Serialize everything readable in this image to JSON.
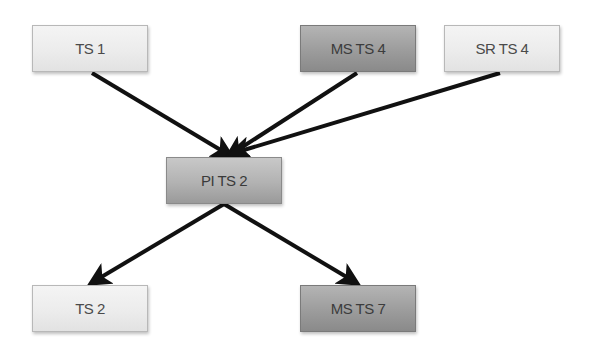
{
  "diagram": {
    "nodes": [
      {
        "id": "ts1",
        "label": "TS 1",
        "shade": "light"
      },
      {
        "id": "msts4",
        "label": "MS TS 4",
        "shade": "dark"
      },
      {
        "id": "srts4",
        "label": "SR TS 4",
        "shade": "light"
      },
      {
        "id": "pits2",
        "label": "PI TS 2",
        "shade": "mid"
      },
      {
        "id": "ts2",
        "label": "TS 2",
        "shade": "light"
      },
      {
        "id": "msts7",
        "label": "MS TS 7",
        "shade": "dark"
      }
    ],
    "edges": [
      {
        "from": "ts1",
        "to": "pits2"
      },
      {
        "from": "msts4",
        "to": "pits2"
      },
      {
        "from": "srts4",
        "to": "pits2"
      },
      {
        "from": "pits2",
        "to": "ts2"
      },
      {
        "from": "pits2",
        "to": "msts7"
      }
    ],
    "colors": {
      "arrow": "#111111",
      "light_node": "#ececec",
      "dark_node": "#9c9c9c",
      "mid_node": "#b2b2b2",
      "text": "#4a4a4a"
    }
  }
}
